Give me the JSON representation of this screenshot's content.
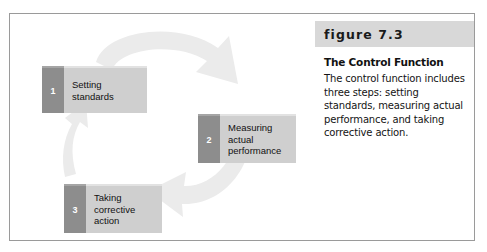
{
  "figure": {
    "number_label": "figure 7.3",
    "title": "The Control Function",
    "body": "The control function includes three steps: setting standards, measuring actual performance, and taking corrective action."
  },
  "diagram": {
    "type": "cycle",
    "direction": "clockwise",
    "steps": [
      {
        "number": "1",
        "lines": [
          "Setting",
          "standards"
        ]
      },
      {
        "number": "2",
        "lines": [
          "Measuring",
          "actual",
          "performance"
        ]
      },
      {
        "number": "3",
        "lines": [
          "Taking",
          "corrective",
          "action"
        ]
      }
    ],
    "arrows": [
      {
        "name": "arrow-1-to-2",
        "from": "1",
        "to": "2"
      },
      {
        "name": "arrow-2-to-3",
        "from": "2",
        "to": "3"
      },
      {
        "name": "arrow-3-to-1",
        "from": "3",
        "to": "1"
      }
    ]
  },
  "colors": {
    "arrow_ring": "#ebebeb",
    "box_body": "#cfcfcf",
    "box_number_tab": "#8d8d8d",
    "caption_band": "#d8d8d8",
    "frame_border": "#9a9a9a",
    "page_background": "#ffffff"
  }
}
